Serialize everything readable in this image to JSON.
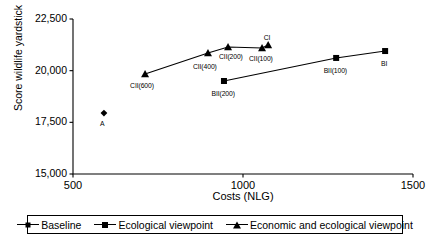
{
  "chart_data": {
    "type": "scatter",
    "title": "",
    "xlabel": "Costs (NLG)",
    "ylabel": "Score wildlife yardstick",
    "xlim": [
      500,
      1500
    ],
    "ylim": [
      15000,
      22500
    ],
    "xticks": [
      "500",
      "1000",
      "1500"
    ],
    "xtick_values": [
      500,
      1000,
      1500
    ],
    "yticks": [
      "15,000",
      "17,500",
      "20,000",
      "22,500"
    ],
    "ytick_values": [
      15000,
      17500,
      20000,
      22500
    ],
    "grid": false,
    "legend_position": "bottom",
    "series": [
      {
        "name": "Baseline",
        "marker": "diamond",
        "connected": false,
        "points": [
          {
            "label": "A",
            "x": 591,
            "y": 17950,
            "label_dx": -2,
            "label_dy": 7
          }
        ]
      },
      {
        "name": "Ecological viewpoint",
        "marker": "square",
        "connected": true,
        "points": [
          {
            "label": "BII(200)",
            "x": 944,
            "y": 19500,
            "label_dx": -1,
            "label_dy": 9
          },
          {
            "label": "BII(100)",
            "x": 1274,
            "y": 20615,
            "label_dx": -1,
            "label_dy": 9
          },
          {
            "label": "BI",
            "x": 1418,
            "y": 20950,
            "label_dx": -1,
            "label_dy": 9
          }
        ]
      },
      {
        "name": "Economic and ecological viewpoint",
        "marker": "triangle",
        "connected": true,
        "points": [
          {
            "label": "CII(600)",
            "x": 712,
            "y": 19840,
            "label_dx": -3,
            "label_dy": 8
          },
          {
            "label": "CII(400)",
            "x": 897,
            "y": 20855,
            "label_dx": -3,
            "label_dy": 10
          },
          {
            "label": "CII(200)",
            "x": 956,
            "y": 21145,
            "label_dx": 3,
            "label_dy": 6
          },
          {
            "label": "CII(100)",
            "x": 1056,
            "y": 21100,
            "label_dx": -1,
            "label_dy": 7
          },
          {
            "label": "CI",
            "x": 1074,
            "y": 21240,
            "label_dx": -1,
            "label_dy": -11
          }
        ]
      }
    ]
  },
  "legend": {
    "entries": [
      {
        "label": "Baseline",
        "marker": "diamond"
      },
      {
        "label": "Ecological viewpoint",
        "marker": "square"
      },
      {
        "label": "Economic and ecological viewpoint",
        "marker": "triangle"
      }
    ]
  },
  "colors": {
    "axis": "#000000",
    "marker": "#000000",
    "line": "#000000",
    "background": "#ffffff"
  }
}
